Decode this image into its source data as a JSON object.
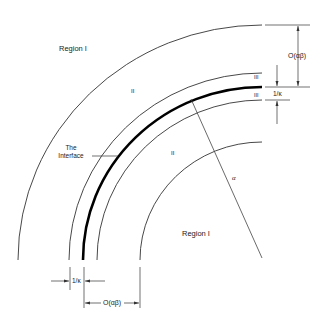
{
  "diagram": {
    "regions": {
      "outer_region": "Region I",
      "inner_region": "Region I",
      "upper_layer": "II",
      "lower_layer": "II",
      "thin_layer_upper": "III",
      "thin_layer_lower": "III"
    },
    "interface_label_line1": "The",
    "interface_label_line2": "Interface",
    "radius_label": "α",
    "dimensions": {
      "right_outer_thickness": "O(αβ)",
      "right_thin_thickness": "1/κ",
      "bottom_thin_thickness": "1/κ",
      "bottom_outer_thickness": "O(αβ)"
    },
    "colors": {
      "line": "#333333",
      "interface": "#000000",
      "background": "#ffffff"
    }
  }
}
